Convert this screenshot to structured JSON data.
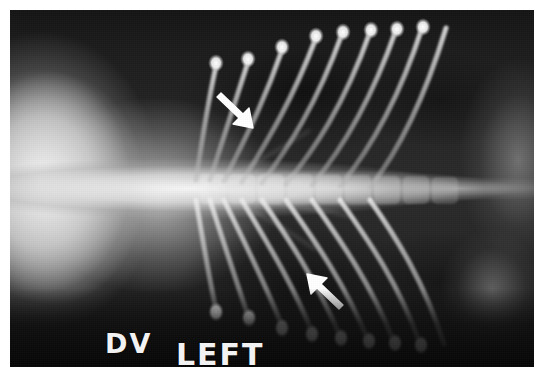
{
  "image": {
    "modality": "radiograph",
    "view": "DV",
    "subject": "thorax",
    "background_color": "#ffffff",
    "film_color": "#1c1c1c",
    "marker_color": "#f2f2f2",
    "arrow_color": "#ffffff",
    "bone_color": "#e8e8e8"
  },
  "markers": {
    "dv": "DV",
    "left": "LEFT"
  },
  "annotations": [
    {
      "name": "arrow-upper",
      "label": "↘",
      "direction": "down-right",
      "x": 222,
      "y": 86
    },
    {
      "name": "arrow-lower",
      "label": "↖",
      "direction": "up-left",
      "x": 300,
      "y": 282
    }
  ],
  "anatomy": {
    "spine_label": "vertebral-column",
    "mediastinum_label": "mediastinum",
    "lung_left_label": "left-lung-field",
    "lung_right_label": "right-lung-field",
    "rib_count_upper": 9,
    "rib_count_lower": 9
  }
}
